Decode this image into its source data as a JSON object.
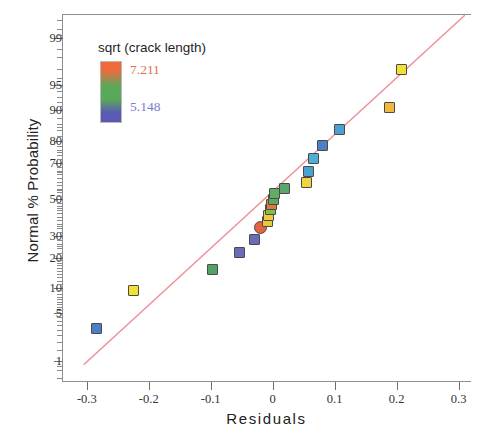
{
  "chart_data": {
    "type": "scatter",
    "title": "",
    "xlabel": "Residuals",
    "ylabel": "Normal % Probability",
    "xlim": [
      -0.34,
      0.32
    ],
    "ylim_probability": [
      0.4,
      99.7
    ],
    "grid": false,
    "x_ticks": [
      -0.3,
      -0.2,
      -0.1,
      0,
      0.1,
      0.2,
      0.3
    ],
    "x_tick_labels": [
      "-0.3",
      "-0.2",
      "-0.1",
      "0",
      "0.1",
      "0.2",
      "0.3"
    ],
    "y_ticks": [
      1,
      5,
      10,
      20,
      30,
      50,
      70,
      80,
      90,
      95,
      99
    ],
    "y_tick_labels": [
      "1",
      "5",
      "10",
      "20",
      "30",
      "50",
      "70",
      "80",
      "90",
      "95",
      "99"
    ],
    "reference_line": {
      "name": "normal-reference-line",
      "color": "#f08f97",
      "x_start": -0.305,
      "y_start": 0.85,
      "x_end": 0.31,
      "y_end": 99.6
    },
    "legend": {
      "title": "sqrt (crack length)",
      "max_label": "7.211",
      "min_label": "5.148",
      "max_color": "#ee6a3a",
      "mid_color": "#5aa85a",
      "min_color": "#5a5ab4",
      "max_label_color": "#e0714a",
      "min_label_color": "#7b7bd0"
    },
    "points": [
      {
        "x": -0.285,
        "p": 3.1,
        "color": "#4d7fc4",
        "shape": "square"
      },
      {
        "x": -0.225,
        "p": 9.4,
        "color": "#f0e038",
        "shape": "square"
      },
      {
        "x": -0.097,
        "p": 15.6,
        "color": "#53a06b",
        "shape": "square"
      },
      {
        "x": -0.053,
        "p": 21.9,
        "color": "#6a6ab8",
        "shape": "square"
      },
      {
        "x": -0.03,
        "p": 28.1,
        "color": "#6a6ab8",
        "shape": "square"
      },
      {
        "x": -0.019,
        "p": 34.4,
        "color": "#e4643f",
        "shape": "circle"
      },
      {
        "x": -0.009,
        "p": 37.5,
        "color": "#e8c93c",
        "shape": "square"
      },
      {
        "x": -0.006,
        "p": 40.6,
        "color": "#f0c83c",
        "shape": "square"
      },
      {
        "x": -0.004,
        "p": 43.8,
        "color": "#7dbe4e",
        "shape": "square"
      },
      {
        "x": -0.002,
        "p": 46.9,
        "color": "#e2783c",
        "shape": "square"
      },
      {
        "x": 0.001,
        "p": 50.0,
        "color": "#5fa85f",
        "shape": "square"
      },
      {
        "x": 0.003,
        "p": 53.1,
        "color": "#63ad63",
        "shape": "square"
      },
      {
        "x": 0.019,
        "p": 56.2,
        "color": "#58a86e",
        "shape": "square"
      },
      {
        "x": 0.055,
        "p": 59.4,
        "color": "#f0d63c",
        "shape": "square"
      },
      {
        "x": 0.057,
        "p": 65.6,
        "color": "#4d9fd0",
        "shape": "square"
      },
      {
        "x": 0.066,
        "p": 71.9,
        "color": "#4dafd4",
        "shape": "square"
      },
      {
        "x": 0.081,
        "p": 78.1,
        "color": "#4d7fc4",
        "shape": "square"
      },
      {
        "x": 0.107,
        "p": 84.4,
        "color": "#4d9fd4",
        "shape": "square"
      },
      {
        "x": 0.188,
        "p": 90.6,
        "color": "#f0b83c",
        "shape": "square"
      },
      {
        "x": 0.208,
        "p": 96.9,
        "color": "#f0e038",
        "shape": "square"
      }
    ]
  }
}
